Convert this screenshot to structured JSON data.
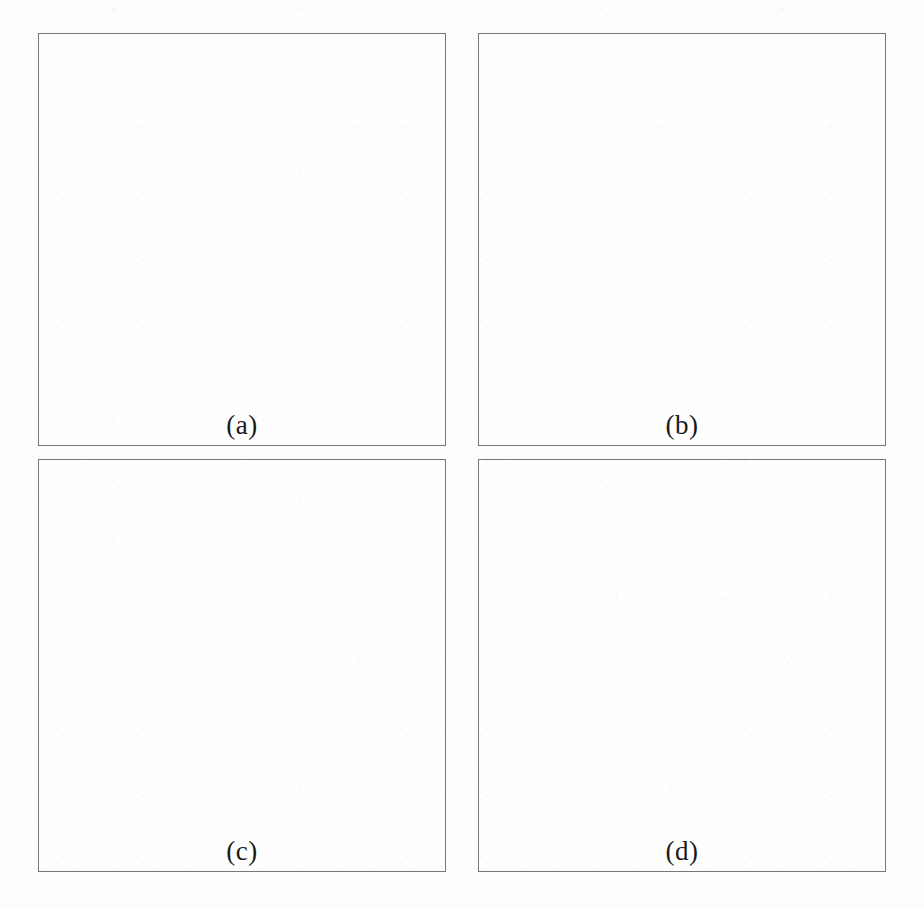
{
  "figure": {
    "layout": "2x2",
    "background_color": "#fdfdfd",
    "panels": [
      {
        "id": "a",
        "label": "(a)",
        "caption": "adaptive mesh refinement grid with velocity field",
        "shows_grid": true,
        "shows_vectors": true,
        "shows_disk": false,
        "shows_spiral": false
      },
      {
        "id": "b",
        "label": "(b)",
        "caption": "sheared filament interface on refined grid",
        "shows_grid": true,
        "shows_vectors": true,
        "shows_disk": false,
        "shows_spiral": true
      },
      {
        "id": "c",
        "label": "(c)",
        "caption": "circular tracer body resolved on refined grid",
        "shows_grid": true,
        "shows_vectors": true,
        "shows_disk": true,
        "shows_spiral": false
      },
      {
        "id": "d",
        "label": "(d)",
        "caption": "circular tracer body with sheared filament overlay",
        "shows_grid": true,
        "shows_vectors": true,
        "shows_disk": true,
        "shows_spiral": true
      }
    ]
  },
  "colors": {
    "panel_border": "#777777",
    "grid_line": "#9a9a9a",
    "grid_line_fine": "#8a8a8a",
    "vector_arrow": "#6b6b6b",
    "vector_head": "#3a3a3a",
    "disk_fill": "#bdbdbd",
    "disk_edge": "#8f8f8f",
    "spiral_fill": "#4a4a4a",
    "label_text": "#1a1a1a",
    "paper": "#fdfdfd"
  },
  "chart_data": {
    "type": "scatter",
    "subtitle": "Four panels (a)-(d) over an identical unit-square domain",
    "xlabel": "",
    "ylabel": "",
    "xlim": [
      0,
      1
    ],
    "ylim": [
      0,
      1
    ],
    "grid": true,
    "legend_position": "none",
    "annotations": [
      "(a)",
      "(b)",
      "(c)",
      "(d)"
    ],
    "velocity_field": {
      "description": "Single solid-body-like vortex, counter-clockwise, centered in the domain; magnitude peaks at mid-radius and decays toward the center and the outer boundary.",
      "formula_u": "-(y - yc)",
      "formula_v": "(x - xc)",
      "center": [
        0.5,
        0.5
      ],
      "rotation": "counter-clockwise",
      "nx": 16,
      "ny": 16,
      "arrow_scale": 0.052,
      "max_speed": 1.0
    },
    "amr_grid": {
      "description": "Block-structured adaptive mesh. A coarse 3x3 base partition of the domain, a level-1 refinement patch covering the central region, and deeply nested level-2/3/4 staircase blocks tracking the interface at the upper-right and lower-left of the central patch.",
      "base_levels": 4,
      "refinement_ratio": 2,
      "base_partition_x": [
        0.0,
        0.333,
        0.667,
        1.0
      ],
      "base_partition_y": [
        0.0,
        0.333,
        0.667,
        1.0
      ],
      "level1_patch": [
        0.27,
        0.27,
        0.76,
        0.74
      ],
      "level1_columns": [
        0.27,
        0.39,
        0.52,
        0.63,
        0.72,
        0.76
      ],
      "level1_rows": [
        0.27,
        0.4,
        0.52,
        0.62,
        0.74
      ],
      "nested_corners": [
        {
          "corner": "upper-right",
          "x": 0.665,
          "y": 0.62,
          "w": 0.095,
          "h": 0.12,
          "depth": 4
        },
        {
          "corner": "lower-left",
          "x": 0.275,
          "y": 0.27,
          "w": 0.095,
          "h": 0.12,
          "depth": 4
        }
      ]
    },
    "disk": {
      "description": "Filled circular tracer region with a staircase (cell-resolved) boundary.",
      "center": [
        0.5,
        0.5
      ],
      "radius": 0.265,
      "fill": "#bdbdbd",
      "staircase_steps": 34
    },
    "spiral": {
      "description": "Two overlapping sheared crescent arcs forming a nearly closed ring; the interface has been wound by the vortex.",
      "center": [
        0.5,
        0.5
      ],
      "outer_radius": 0.29,
      "inner_radius": 0.205,
      "arcs": [
        {
          "start_deg": 100,
          "sweep_deg": 300,
          "thickness": 0.072
        },
        {
          "start_deg": 285,
          "sweep_deg": 295,
          "thickness": 0.06
        }
      ],
      "fill": "#4a4a4a"
    }
  }
}
